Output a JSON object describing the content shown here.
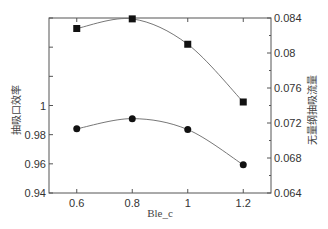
{
  "chart_data": {
    "type": "line",
    "title": "",
    "xlabel": "Ble_c",
    "ylabel_left": "抽吸口效率",
    "ylabel_right": "无量纲抽吸流量",
    "x": [
      0.6,
      0.8,
      1.0,
      1.2
    ],
    "xlim": [
      0.5,
      1.3
    ],
    "x_ticks": [
      "0.6",
      "0.8",
      "1",
      "1.2"
    ],
    "ylim_left": [
      0.94,
      1.06
    ],
    "y_ticks_left": [
      "0.94",
      "0.96",
      "0.98",
      "1"
    ],
    "ylim_right": [
      0.064,
      0.084
    ],
    "y_ticks_right": [
      "0.064",
      "0.068",
      "0.072",
      "0.076",
      "0.08",
      "0.084"
    ],
    "grid": false,
    "legend": null,
    "series": [
      {
        "name": "抽吸口效率",
        "axis": "left",
        "marker": "circle",
        "values": [
          0.984,
          0.991,
          0.9835,
          0.9593
        ]
      },
      {
        "name": "无量纲抽吸流量",
        "axis": "right",
        "marker": "square",
        "values": [
          0.0828,
          0.0839,
          0.081,
          0.0744
        ]
      }
    ]
  },
  "colors": {
    "axis": "#555555",
    "curve": "#777777",
    "marker": "#111111",
    "text": "#333333"
  }
}
